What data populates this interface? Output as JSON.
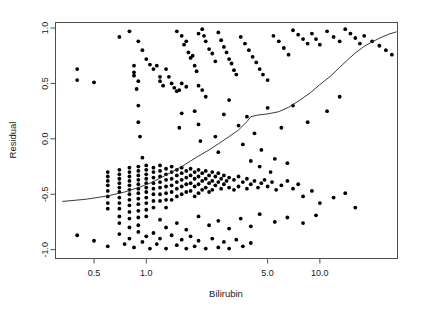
{
  "chart_data": {
    "type": "scatter",
    "title": "",
    "xlabel": "Bilirubin",
    "ylabel": "Residual",
    "xscale": "log",
    "yscale": "linear",
    "xlim": [
      0.3,
      28.0
    ],
    "ylim": [
      -1.08,
      1.05
    ],
    "xticks": [
      0.5,
      1.0,
      5.0,
      10.0
    ],
    "xtick_labels": [
      "0.5",
      "1.0",
      "5.0",
      "10.0"
    ],
    "yticks": [
      1.0,
      0.5,
      0.0,
      -0.5,
      -1.0
    ],
    "ytick_labels": [
      "1.0",
      "0.5",
      "0.0",
      "-0.5",
      "-1.0"
    ],
    "grid": false,
    "legend": false,
    "marker": "filled-circle",
    "marker_color": "#000000",
    "smoother_color": "#3a3a3a",
    "smoother_label": "lowess smooth",
    "points": [
      [
        0.4,
        0.63
      ],
      [
        0.4,
        0.53
      ],
      [
        0.5,
        0.51
      ],
      [
        0.7,
        0.92
      ],
      [
        0.8,
        0.97
      ],
      [
        0.9,
        0.88
      ],
      [
        0.95,
        0.8
      ],
      [
        0.85,
        0.66
      ],
      [
        0.85,
        0.6
      ],
      [
        0.85,
        0.57
      ],
      [
        0.9,
        0.52
      ],
      [
        0.88,
        0.45
      ],
      [
        0.9,
        0.3
      ],
      [
        0.9,
        0.15
      ],
      [
        0.92,
        0.02
      ],
      [
        0.95,
        -0.17
      ],
      [
        1.0,
        0.72
      ],
      [
        1.05,
        0.67
      ],
      [
        1.1,
        0.63
      ],
      [
        1.15,
        0.66
      ],
      [
        1.2,
        0.56
      ],
      [
        1.2,
        0.52
      ],
      [
        1.25,
        0.48
      ],
      [
        1.3,
        0.63
      ],
      [
        1.35,
        0.56
      ],
      [
        1.4,
        0.5
      ],
      [
        1.45,
        0.46
      ],
      [
        1.5,
        0.43
      ],
      [
        1.55,
        0.44
      ],
      [
        1.6,
        0.5
      ],
      [
        1.7,
        0.47
      ],
      [
        1.5,
        0.97
      ],
      [
        1.6,
        0.93
      ],
      [
        1.65,
        0.85
      ],
      [
        1.7,
        0.88
      ],
      [
        1.75,
        0.78
      ],
      [
        1.8,
        0.73
      ],
      [
        1.85,
        0.75
      ],
      [
        1.9,
        0.66
      ],
      [
        1.95,
        0.61
      ],
      [
        2.0,
        0.95
      ],
      [
        2.1,
        0.99
      ],
      [
        2.15,
        0.93
      ],
      [
        2.2,
        0.88
      ],
      [
        2.3,
        0.81
      ],
      [
        2.4,
        0.77
      ],
      [
        2.5,
        0.7
      ],
      [
        2.0,
        0.48
      ],
      [
        2.1,
        0.44
      ],
      [
        2.2,
        0.38
      ],
      [
        1.9,
        0.25
      ],
      [
        2.0,
        0.13
      ],
      [
        2.05,
        -0.02
      ],
      [
        1.6,
        0.23
      ],
      [
        1.55,
        0.1
      ],
      [
        2.6,
        0.96
      ],
      [
        2.7,
        0.89
      ],
      [
        2.8,
        0.83
      ],
      [
        2.9,
        0.78
      ],
      [
        3.0,
        0.72
      ],
      [
        3.1,
        0.68
      ],
      [
        3.2,
        0.62
      ],
      [
        3.3,
        0.58
      ],
      [
        3.5,
        0.92
      ],
      [
        3.7,
        0.86
      ],
      [
        3.9,
        0.8
      ],
      [
        4.1,
        0.74
      ],
      [
        4.3,
        0.69
      ],
      [
        4.5,
        0.63
      ],
      [
        4.7,
        0.58
      ],
      [
        5.0,
        0.53
      ],
      [
        5.4,
        0.93
      ],
      [
        5.8,
        0.88
      ],
      [
        6.2,
        0.82
      ],
      [
        6.6,
        0.76
      ],
      [
        7.0,
        0.98
      ],
      [
        7.5,
        0.94
      ],
      [
        8.0,
        0.9
      ],
      [
        8.5,
        0.86
      ],
      [
        9.0,
        0.95
      ],
      [
        9.5,
        0.9
      ],
      [
        10.0,
        0.85
      ],
      [
        11.0,
        0.97
      ],
      [
        12.0,
        0.92
      ],
      [
        13.0,
        0.88
      ],
      [
        14.0,
        0.99
      ],
      [
        15.0,
        0.95
      ],
      [
        16.0,
        0.91
      ],
      [
        17.0,
        0.86
      ],
      [
        18.0,
        0.93
      ],
      [
        20.0,
        0.88
      ],
      [
        22.0,
        0.84
      ],
      [
        24.0,
        0.8
      ],
      [
        26.0,
        0.76
      ],
      [
        0.6,
        -0.3
      ],
      [
        0.6,
        -0.34
      ],
      [
        0.6,
        -0.38
      ],
      [
        0.6,
        -0.42
      ],
      [
        0.6,
        -0.47
      ],
      [
        0.6,
        -0.52
      ],
      [
        0.6,
        -0.58
      ],
      [
        0.6,
        -0.63
      ],
      [
        0.7,
        -0.28
      ],
      [
        0.7,
        -0.32
      ],
      [
        0.7,
        -0.36
      ],
      [
        0.7,
        -0.4
      ],
      [
        0.7,
        -0.44
      ],
      [
        0.7,
        -0.48
      ],
      [
        0.7,
        -0.53
      ],
      [
        0.7,
        -0.58
      ],
      [
        0.7,
        -0.63
      ],
      [
        0.7,
        -0.7
      ],
      [
        0.7,
        -0.76
      ],
      [
        0.8,
        -0.26
      ],
      [
        0.8,
        -0.3
      ],
      [
        0.8,
        -0.34
      ],
      [
        0.8,
        -0.38
      ],
      [
        0.8,
        -0.42
      ],
      [
        0.8,
        -0.46
      ],
      [
        0.8,
        -0.5
      ],
      [
        0.8,
        -0.55
      ],
      [
        0.8,
        -0.6
      ],
      [
        0.8,
        -0.66
      ],
      [
        0.8,
        -0.72
      ],
      [
        0.8,
        -0.8
      ],
      [
        0.9,
        -0.25
      ],
      [
        0.9,
        -0.29
      ],
      [
        0.9,
        -0.33
      ],
      [
        0.9,
        -0.37
      ],
      [
        0.9,
        -0.41
      ],
      [
        0.9,
        -0.45
      ],
      [
        0.9,
        -0.49
      ],
      [
        0.9,
        -0.54
      ],
      [
        0.9,
        -0.59
      ],
      [
        0.9,
        -0.65
      ],
      [
        0.9,
        -0.71
      ],
      [
        0.9,
        -0.78
      ],
      [
        1.0,
        -0.24
      ],
      [
        1.0,
        -0.28
      ],
      [
        1.0,
        -0.32
      ],
      [
        1.0,
        -0.36
      ],
      [
        1.0,
        -0.4
      ],
      [
        1.0,
        -0.44
      ],
      [
        1.0,
        -0.48
      ],
      [
        1.0,
        -0.53
      ],
      [
        1.0,
        -0.58
      ],
      [
        1.0,
        -0.64
      ],
      [
        1.0,
        -0.7
      ],
      [
        1.1,
        -0.26
      ],
      [
        1.1,
        -0.3
      ],
      [
        1.1,
        -0.35
      ],
      [
        1.1,
        -0.4
      ],
      [
        1.1,
        -0.45
      ],
      [
        1.1,
        -0.5
      ],
      [
        1.1,
        -0.56
      ],
      [
        1.1,
        -0.62
      ],
      [
        1.2,
        -0.24
      ],
      [
        1.2,
        -0.29
      ],
      [
        1.2,
        -0.34
      ],
      [
        1.2,
        -0.39
      ],
      [
        1.2,
        -0.44
      ],
      [
        1.2,
        -0.5
      ],
      [
        1.2,
        -0.56
      ],
      [
        1.3,
        -0.27
      ],
      [
        1.3,
        -0.32
      ],
      [
        1.3,
        -0.37
      ],
      [
        1.3,
        -0.43
      ],
      [
        1.3,
        -0.49
      ],
      [
        1.3,
        -0.55
      ],
      [
        1.3,
        -0.62
      ],
      [
        1.4,
        -0.25
      ],
      [
        1.4,
        -0.3
      ],
      [
        1.4,
        -0.36
      ],
      [
        1.4,
        -0.42
      ],
      [
        1.4,
        -0.48
      ],
      [
        1.4,
        -0.55
      ],
      [
        1.5,
        -0.28
      ],
      [
        1.5,
        -0.33
      ],
      [
        1.5,
        -0.39
      ],
      [
        1.5,
        -0.45
      ],
      [
        1.5,
        -0.52
      ],
      [
        1.6,
        -0.26
      ],
      [
        1.6,
        -0.31
      ],
      [
        1.6,
        -0.37
      ],
      [
        1.6,
        -0.43
      ],
      [
        1.6,
        -0.5
      ],
      [
        1.7,
        -0.29
      ],
      [
        1.7,
        -0.35
      ],
      [
        1.7,
        -0.41
      ],
      [
        1.7,
        -0.48
      ],
      [
        1.8,
        -0.27
      ],
      [
        1.8,
        -0.33
      ],
      [
        1.8,
        -0.4
      ],
      [
        1.8,
        -0.47
      ],
      [
        1.9,
        -0.3
      ],
      [
        1.9,
        -0.36
      ],
      [
        1.9,
        -0.43
      ],
      [
        1.9,
        -0.52
      ],
      [
        2.0,
        -0.28
      ],
      [
        2.0,
        -0.34
      ],
      [
        2.0,
        -0.41
      ],
      [
        2.0,
        -0.49
      ],
      [
        2.1,
        -0.31
      ],
      [
        2.1,
        -0.38
      ],
      [
        2.1,
        -0.46
      ],
      [
        2.2,
        -0.29
      ],
      [
        2.2,
        -0.36
      ],
      [
        2.2,
        -0.44
      ],
      [
        2.3,
        -0.33
      ],
      [
        2.3,
        -0.4
      ],
      [
        2.3,
        -0.48
      ],
      [
        2.4,
        -0.3
      ],
      [
        2.4,
        -0.38
      ],
      [
        2.4,
        -0.46
      ],
      [
        2.5,
        -0.34
      ],
      [
        2.5,
        -0.42
      ],
      [
        2.6,
        -0.31
      ],
      [
        2.6,
        -0.39
      ],
      [
        2.7,
        -0.36
      ],
      [
        2.7,
        -0.45
      ],
      [
        2.8,
        -0.33
      ],
      [
        2.8,
        -0.41
      ],
      [
        2.9,
        -0.38
      ],
      [
        3.0,
        -0.35
      ],
      [
        3.0,
        -0.44
      ],
      [
        3.2,
        -0.37
      ],
      [
        3.2,
        -0.46
      ],
      [
        3.4,
        -0.34
      ],
      [
        3.4,
        -0.43
      ],
      [
        3.6,
        -0.39
      ],
      [
        3.8,
        -0.36
      ],
      [
        3.8,
        -0.45
      ],
      [
        4.0,
        -0.41
      ],
      [
        4.2,
        -0.38
      ],
      [
        4.4,
        -0.44
      ],
      [
        4.6,
        -0.4
      ],
      [
        4.8,
        -0.37
      ],
      [
        5.0,
        -0.43
      ],
      [
        5.3,
        -0.39
      ],
      [
        5.6,
        -0.46
      ],
      [
        6.0,
        -0.42
      ],
      [
        6.5,
        -0.38
      ],
      [
        7.0,
        -0.45
      ],
      [
        7.5,
        -0.41
      ],
      [
        8.0,
        -0.52
      ],
      [
        9.0,
        -0.47
      ],
      [
        10.0,
        -0.58
      ],
      [
        12.0,
        -0.53
      ],
      [
        14.0,
        -0.49
      ],
      [
        16.0,
        -0.62
      ],
      [
        0.4,
        -0.87
      ],
      [
        0.5,
        -0.92
      ],
      [
        0.6,
        -0.97
      ],
      [
        0.7,
        -0.86
      ],
      [
        0.75,
        -0.95
      ],
      [
        0.8,
        -0.9
      ],
      [
        0.85,
        -0.98
      ],
      [
        0.9,
        -0.84
      ],
      [
        0.95,
        -0.93
      ],
      [
        1.0,
        -0.88
      ],
      [
        1.05,
        -0.99
      ],
      [
        1.1,
        -0.85
      ],
      [
        1.15,
        -0.95
      ],
      [
        1.2,
        -0.9
      ],
      [
        1.3,
        -0.99
      ],
      [
        1.4,
        -0.87
      ],
      [
        1.5,
        -0.96
      ],
      [
        1.6,
        -0.91
      ],
      [
        1.7,
        -0.99
      ],
      [
        1.8,
        -0.88
      ],
      [
        1.9,
        -0.97
      ],
      [
        2.0,
        -0.92
      ],
      [
        2.2,
        -0.99
      ],
      [
        2.4,
        -0.9
      ],
      [
        2.6,
        -0.98
      ],
      [
        2.8,
        -0.93
      ],
      [
        3.0,
        -0.99
      ],
      [
        3.3,
        -0.91
      ],
      [
        3.6,
        -0.97
      ],
      [
        4.0,
        -0.94
      ],
      [
        1.2,
        -0.73
      ],
      [
        1.3,
        -0.8
      ],
      [
        1.5,
        -0.76
      ],
      [
        1.7,
        -0.82
      ],
      [
        2.0,
        -0.7
      ],
      [
        2.3,
        -0.78
      ],
      [
        2.6,
        -0.74
      ],
      [
        3.0,
        -0.81
      ],
      [
        3.5,
        -0.72
      ],
      [
        4.0,
        -0.79
      ],
      [
        4.5,
        -0.68
      ],
      [
        5.5,
        -0.75
      ],
      [
        6.5,
        -0.71
      ],
      [
        8.0,
        -0.76
      ],
      [
        9.5,
        -0.69
      ],
      [
        3.8,
        0.2
      ],
      [
        4.2,
        0.05
      ],
      [
        4.6,
        -0.1
      ],
      [
        5.0,
        0.28
      ],
      [
        3.0,
        0.35
      ],
      [
        3.4,
        0.12
      ],
      [
        2.8,
        0.22
      ],
      [
        6.0,
        0.1
      ],
      [
        7.0,
        0.3
      ],
      [
        8.5,
        0.15
      ],
      [
        11.0,
        0.25
      ],
      [
        13.0,
        0.38
      ],
      [
        4.0,
        -0.2
      ],
      [
        4.5,
        -0.25
      ],
      [
        5.5,
        -0.18
      ],
      [
        6.5,
        -0.22
      ],
      [
        2.5,
        0.02
      ],
      [
        2.6,
        -0.12
      ],
      [
        3.6,
        -0.05
      ],
      [
        5.2,
        -0.3
      ]
    ],
    "smoother": [
      [
        0.33,
        -0.565
      ],
      [
        0.45,
        -0.545
      ],
      [
        0.6,
        -0.515
      ],
      [
        0.75,
        -0.48
      ],
      [
        0.9,
        -0.44
      ],
      [
        1.05,
        -0.4
      ],
      [
        1.2,
        -0.355
      ],
      [
        1.4,
        -0.3
      ],
      [
        1.6,
        -0.25
      ],
      [
        1.8,
        -0.2
      ],
      [
        2.0,
        -0.155
      ],
      [
        2.3,
        -0.1
      ],
      [
        2.6,
        -0.045
      ],
      [
        3.0,
        0.02
      ],
      [
        3.4,
        0.08
      ],
      [
        3.8,
        0.155
      ],
      [
        4.0,
        0.2
      ],
      [
        4.4,
        0.215
      ],
      [
        5.0,
        0.225
      ],
      [
        5.8,
        0.245
      ],
      [
        6.6,
        0.285
      ],
      [
        7.6,
        0.345
      ],
      [
        8.8,
        0.415
      ],
      [
        10.0,
        0.49
      ],
      [
        11.5,
        0.565
      ],
      [
        13.0,
        0.645
      ],
      [
        14.5,
        0.715
      ],
      [
        16.0,
        0.775
      ],
      [
        18.0,
        0.835
      ],
      [
        20.0,
        0.875
      ],
      [
        22.5,
        0.915
      ],
      [
        25.0,
        0.945
      ],
      [
        27.5,
        0.965
      ]
    ]
  }
}
